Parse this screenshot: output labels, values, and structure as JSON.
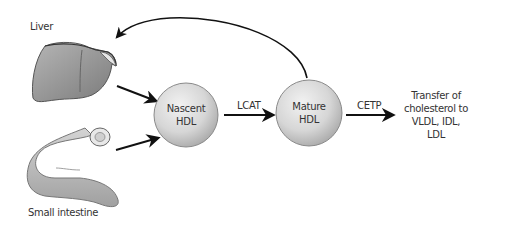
{
  "diagram": {
    "sources": [
      {
        "id": "liver",
        "label": "Liver"
      },
      {
        "id": "small_intestine",
        "label": "Small intestine"
      }
    ],
    "nodes": [
      {
        "id": "nascent_hdl",
        "line1": "Nascent",
        "line2": "HDL"
      },
      {
        "id": "mature_hdl",
        "line1": "Mature",
        "line2": "HDL"
      }
    ],
    "edges": [
      {
        "from": "liver",
        "to": "nascent_hdl",
        "label": ""
      },
      {
        "from": "small_intestine",
        "to": "nascent_hdl",
        "label": ""
      },
      {
        "from": "nascent_hdl",
        "to": "mature_hdl",
        "label": "LCAT"
      },
      {
        "from": "mature_hdl",
        "to": "result",
        "label": "CETP"
      },
      {
        "from": "mature_hdl",
        "to": "liver",
        "label": ""
      }
    ],
    "result": {
      "lines": [
        "Transfer of",
        "cholesterol to",
        "VLDL, IDL,",
        "LDL"
      ]
    },
    "colors": {
      "arrow": "#111111",
      "circle_fill": "#d9d9d9",
      "circle_stroke": "#8a8a8a",
      "organ_fill": "#a9a9a9",
      "text": "#333333"
    }
  }
}
